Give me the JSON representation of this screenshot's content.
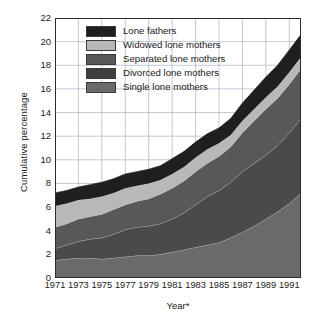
{
  "chart_data": {
    "type": "area",
    "stacked": true,
    "title": "",
    "xlabel": "Year*",
    "ylabel": "Cumulative percentage",
    "xlim": [
      1971,
      1992
    ],
    "ylim": [
      0,
      22
    ],
    "ytick_step": 2,
    "xtick_step": 2,
    "grid": true,
    "legend_position": "top-left-inside",
    "x": [
      1971,
      1972,
      1973,
      1974,
      1975,
      1976,
      1977,
      1978,
      1979,
      1980,
      1981,
      1982,
      1983,
      1984,
      1985,
      1986,
      1987,
      1988,
      1989,
      1990,
      1991,
      1992
    ],
    "xticks": [
      "1971",
      "1973",
      "1975",
      "1977",
      "1979",
      "1981",
      "1983",
      "1985",
      "1987",
      "1989",
      "1991"
    ],
    "yticks": [
      "0",
      "2",
      "4",
      "6",
      "8",
      "10",
      "12",
      "14",
      "16",
      "18",
      "20",
      "22"
    ],
    "series": [
      {
        "name": "Single lone mothers",
        "color": "#6a6a6a",
        "values": [
          1.5,
          1.6,
          1.7,
          1.7,
          1.6,
          1.7,
          1.8,
          1.9,
          1.9,
          2.0,
          2.2,
          2.4,
          2.6,
          2.8,
          3.0,
          3.4,
          3.9,
          4.4,
          5.0,
          5.6,
          6.3,
          7.2
        ]
      },
      {
        "name": "Divorced lone mothers",
        "color": "#4a4a4a",
        "values": [
          1.0,
          1.2,
          1.4,
          1.6,
          1.8,
          2.0,
          2.3,
          2.4,
          2.5,
          2.6,
          2.8,
          3.1,
          3.6,
          4.1,
          4.4,
          4.7,
          5.1,
          5.3,
          5.4,
          5.6,
          6.0,
          6.3
        ]
      },
      {
        "name": "Separated lone mothers",
        "color": "#585858",
        "values": [
          1.8,
          1.8,
          1.9,
          1.9,
          2.0,
          2.1,
          2.1,
          2.2,
          2.3,
          2.5,
          2.6,
          2.7,
          2.8,
          2.8,
          2.9,
          3.0,
          3.3,
          3.6,
          3.9,
          4.0,
          4.1,
          4.2
        ]
      },
      {
        "name": "Widowed lone mothers",
        "color": "#b8b8b8",
        "values": [
          1.8,
          1.7,
          1.6,
          1.5,
          1.5,
          1.4,
          1.4,
          1.3,
          1.3,
          1.2,
          1.2,
          1.2,
          1.2,
          1.2,
          1.1,
          1.0,
          1.0,
          1.0,
          1.0,
          1.0,
          1.0,
          1.0
        ]
      },
      {
        "name": "Lone fathers",
        "color": "#1f1f1f",
        "values": [
          1.1,
          1.1,
          1.1,
          1.2,
          1.2,
          1.2,
          1.2,
          1.2,
          1.2,
          1.2,
          1.3,
          1.3,
          1.3,
          1.3,
          1.3,
          1.4,
          1.5,
          1.6,
          1.7,
          1.8,
          1.9,
          1.9
        ]
      }
    ],
    "cumulative_totals": [
      7.2,
      7.4,
      7.7,
      7.9,
      8.1,
      8.4,
      8.8,
      9.0,
      9.2,
      9.5,
      10.1,
      10.7,
      11.5,
      12.2,
      12.7,
      13.5,
      14.8,
      15.9,
      17.0,
      18.0,
      19.3,
      20.6
    ]
  },
  "legend": {
    "items": [
      {
        "label": "Lone fathers",
        "color": "#1f1f1f"
      },
      {
        "label": "Widowed lone mothers",
        "color": "#b8b8b8"
      },
      {
        "label": "Separated lone mothers",
        "color": "#585858"
      },
      {
        "label": "Divorced lone mothers",
        "color": "#3f3f3f"
      },
      {
        "label": "Single lone mothers",
        "color": "#6a6a6a"
      }
    ]
  }
}
